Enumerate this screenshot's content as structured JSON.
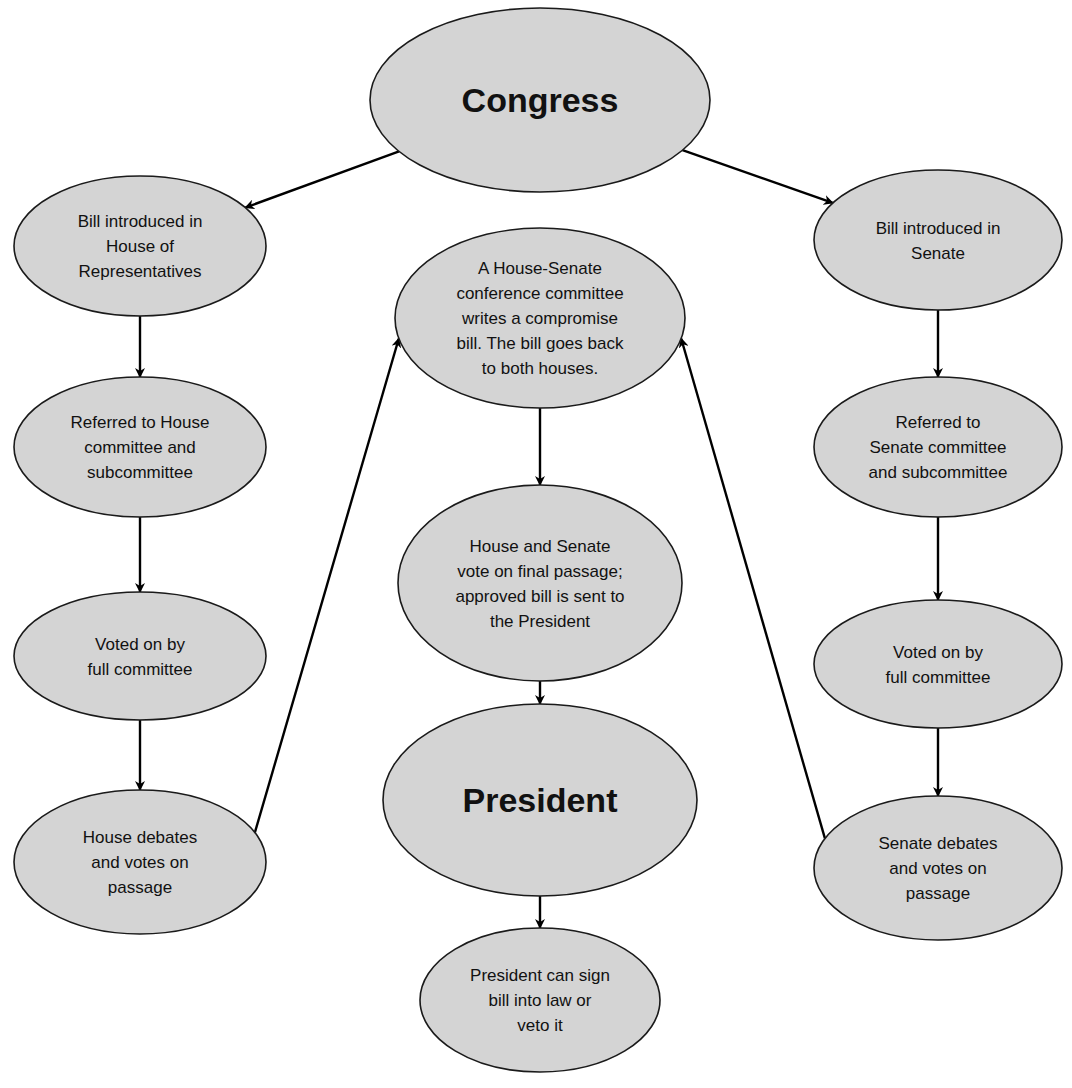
{
  "colors": {
    "node_fill": "#d4d4d4",
    "node_stroke": "#1a1a1a",
    "arrow": "#000000"
  },
  "nodes": [
    {
      "id": "congress",
      "lines": [
        "Congress"
      ],
      "emphasis": true
    },
    {
      "id": "house-intro",
      "lines": [
        "Bill introduced in",
        "House of",
        "Representatives"
      ]
    },
    {
      "id": "senate-intro",
      "lines": [
        "Bill introduced in",
        "Senate"
      ]
    },
    {
      "id": "conference",
      "lines": [
        "A House-Senate",
        "conference committee",
        "writes a compromise",
        "bill.  The bill goes back",
        "to both houses."
      ]
    },
    {
      "id": "house-committee",
      "lines": [
        "Referred to House",
        "committee and",
        "subcommittee"
      ]
    },
    {
      "id": "senate-committee",
      "lines": [
        "Referred to",
        "Senate committee",
        "and subcommittee"
      ]
    },
    {
      "id": "final-passage",
      "lines": [
        "House and Senate",
        "vote on final passage;",
        "approved bill is sent to",
        "the President"
      ]
    },
    {
      "id": "house-full-vote",
      "lines": [
        "Voted on by",
        "full committee"
      ]
    },
    {
      "id": "senate-full-vote",
      "lines": [
        "Voted on by",
        "full committee"
      ]
    },
    {
      "id": "president",
      "lines": [
        "President"
      ],
      "emphasis": true
    },
    {
      "id": "house-debate",
      "lines": [
        "House debates",
        "and votes on",
        "passage"
      ]
    },
    {
      "id": "senate-debate",
      "lines": [
        "Senate debates",
        "and votes on",
        "passage"
      ]
    },
    {
      "id": "sign-veto",
      "lines": [
        "President can sign",
        "bill into law or",
        "veto it"
      ]
    }
  ],
  "edges": [
    {
      "from": "congress",
      "to": "house-intro"
    },
    {
      "from": "congress",
      "to": "senate-intro"
    },
    {
      "from": "house-intro",
      "to": "house-committee"
    },
    {
      "from": "house-committee",
      "to": "house-full-vote"
    },
    {
      "from": "house-full-vote",
      "to": "house-debate"
    },
    {
      "from": "house-debate",
      "to": "conference"
    },
    {
      "from": "senate-intro",
      "to": "senate-committee"
    },
    {
      "from": "senate-committee",
      "to": "senate-full-vote"
    },
    {
      "from": "senate-full-vote",
      "to": "senate-debate"
    },
    {
      "from": "senate-debate",
      "to": "conference"
    },
    {
      "from": "conference",
      "to": "final-passage"
    },
    {
      "from": "final-passage",
      "to": "president"
    },
    {
      "from": "president",
      "to": "sign-veto"
    }
  ]
}
